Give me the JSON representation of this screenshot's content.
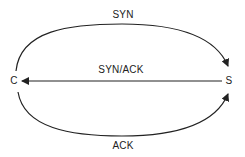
{
  "diagram": {
    "nodes": {
      "client": {
        "label": "C"
      },
      "server": {
        "label": "S"
      }
    },
    "edges": {
      "syn": {
        "label": "SYN",
        "from": "C",
        "to": "S"
      },
      "syn_ack": {
        "label": "SYN/ACK",
        "from": "S",
        "to": "C"
      },
      "ack": {
        "label": "ACK",
        "from": "C",
        "to": "S"
      }
    },
    "colors": {
      "line": "#222222",
      "text": "#222222",
      "background": "#ffffff"
    }
  }
}
